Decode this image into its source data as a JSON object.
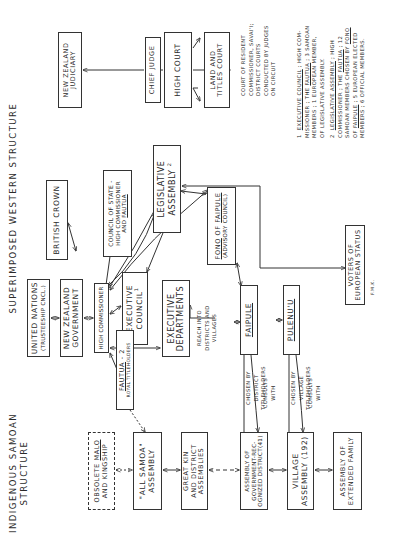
{
  "headings": {
    "western": "SUPERIMPOSED  WESTERN  STRUCTURE",
    "indigenous_line1": "INDIGENOUS  SAMOAN",
    "indigenous_line2": "STRUCTURE"
  },
  "boxes": {
    "united_nations": {
      "line1": "UNITED NATIONS",
      "line2": "(TRUSTEESHIP CNCL.)"
    },
    "nz_government": {
      "line1": "NEW ZEALAND",
      "line2": "GOVERNMENT"
    },
    "british_crown": {
      "line1": "BRITISH CROWN"
    },
    "high_commissioner": {
      "line1": "HIGH COMMISSIONER"
    },
    "council_of_state": {
      "line1": "COUNCIL OF STATE -",
      "line2": "HIGH COMMISSIONER",
      "line3a": "AND",
      "line3b": "FAUTUA"
    },
    "executive_council": {
      "line1": "EXECUTIVE",
      "line2": "COUNCIL",
      "sup": "1"
    },
    "executive_departments": {
      "line1": "EXECUTIVE",
      "line2": "DEPARTMENTS"
    },
    "legislative_assembly": {
      "line1": "LEGISLATIVE",
      "line2": "ASSEMBLY",
      "sup": "2"
    },
    "fono_of_faipule": {
      "line1a": "FONO",
      "line1b": "OF",
      "line1c": "FAIPULE",
      "line2": "(ADVISORY COUNCIL)"
    },
    "faipule": {
      "line1": "FAIPULE"
    },
    "pulenuu": {
      "line1": "PULENU'U"
    },
    "voters_european": {
      "line1": "VOTERS OF",
      "line2": "EUROPEAN STATUS"
    },
    "nz_judiciary": {
      "line1": "NEW ZEALAND",
      "line2": "JUDICIARY"
    },
    "chief_judge": {
      "line1": "CHIEF JUDGE"
    },
    "high_court": {
      "line1": "HIGH COURT"
    },
    "land_titles_court": {
      "line1": "LAND AND",
      "line2": "TITLES COURT"
    },
    "fautua": {
      "line1a": "FAUTUA",
      "line1b": " - 2",
      "line2": "ROYAL TITLEHOLDERS"
    },
    "obsolete_malo": {
      "line1a": "OBSOLETE",
      "line1b": "MALO",
      "line2": "AND KINGSHIP"
    },
    "all_samoa": {
      "line1": "\"ALL SAMOA\"",
      "line2": "ASSEMBLY"
    },
    "great_kin": {
      "line1": "GREAT KIN",
      "line2": "AND DISTRICT",
      "line3": "ASSEMBLIES"
    },
    "gov_recognized": {
      "line1": "ASSEMBLY OF",
      "line2": "GOVERNMENT-REC-",
      "line3": "OGNIZED DISTRICT(41)"
    },
    "village_assembly": {
      "line1": "VILLAGE",
      "line2": "ASSEMBLY (192)"
    },
    "extended_family": {
      "line1": "ASSEMBLY OF",
      "line2": "EXTENDED FAMILY"
    }
  },
  "labels": {
    "reach_into": [
      "REACH INTO",
      "DISTRICTS AND",
      "VILLAGES"
    ],
    "chosen_district": [
      "CHOSEN BY",
      "DISTRICT",
      "TITLEHOLDERS"
    ],
    "consults_1": [
      "CONSULTS",
      "WITH"
    ],
    "chosen_village": [
      "CHOSEN BY",
      "VILLAGE",
      "TITLEHOLDERS"
    ],
    "consults_2": [
      "CONSULTS",
      "WITH"
    ],
    "court_resident": [
      "COURT OF RESIDENT",
      "COMMISSIONER, SAVAI'I;",
      "DISTRICT COURTS",
      "CONDUCTED BY JUDGES",
      "ON CIRCUIT"
    ]
  },
  "notes": {
    "note1_num": "1",
    "note1_title": "EXECUTIVE COUNCIL",
    "note1_text_a": " ; HIGH COM-",
    "note1_text_b": "MISSIONER ; THE ",
    "note1_fautua": "FAUTUA",
    "note1_text_c": " ; 3 SAMOAN",
    "note1_text_d": "MEMBERS ; 1 EUROPEAN MEMBER,",
    "note1_text_e": "OF LEGISLATIVE ASSEMBLY.",
    "note2_num": "2",
    "note2_title": "LEGISLATIVE ASSEMBLY",
    "note2_text_a": " ; HIGH",
    "note2_text_b": "COMMISSIONER ; THE ",
    "note2_fautua": "FAUTUA",
    "note2_text_c": " ; 12",
    "note2_text_d": "SAMOAN MEMBERS CHOSEN BY ",
    "note2_fono": "FONO",
    "note2_text_e": "OF ",
    "note2_faipule": "FAIPULE",
    "note2_text_f": " ; 5 EUROPEAN ELECTED",
    "note2_text_g": "MEMBERS ; 6 OFFICIAL MEMBERS.",
    "signature": "F.M.K."
  }
}
